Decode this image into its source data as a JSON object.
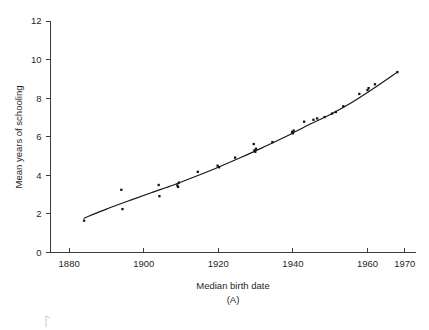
{
  "chart_data": {
    "type": "scatter",
    "title": "",
    "xlabel": "Median birth date",
    "ylabel": "Mean years of schooling",
    "panel_label": "(A)",
    "xlim": [
      1875,
      1973
    ],
    "ylim": [
      0,
      12
    ],
    "xticks": [
      1880,
      1900,
      1920,
      1940,
      1960,
      1970
    ],
    "xtick_labels": [
      "1880",
      "1900",
      "1920",
      "1940",
      "1960",
      "1970"
    ],
    "yticks": [
      0,
      2,
      4,
      6,
      8,
      10,
      12
    ],
    "ytick_labels": [
      "0",
      "2",
      "4",
      "6",
      "8",
      "10",
      "12"
    ],
    "grid": false,
    "legend": "none",
    "marker": "small filled square",
    "marker_color": "#141414",
    "line_color": "#161616",
    "background_color": "#ffffff",
    "points": [
      {
        "x": 1884.0,
        "y": 1.65
      },
      {
        "x": 1894.0,
        "y": 3.25
      },
      {
        "x": 1894.3,
        "y": 2.25
      },
      {
        "x": 1904.0,
        "y": 3.5
      },
      {
        "x": 1904.2,
        "y": 2.92
      },
      {
        "x": 1909.0,
        "y": 3.48
      },
      {
        "x": 1909.2,
        "y": 3.4
      },
      {
        "x": 1909.4,
        "y": 3.62
      },
      {
        "x": 1914.5,
        "y": 4.18
      },
      {
        "x": 1919.8,
        "y": 4.5
      },
      {
        "x": 1920.2,
        "y": 4.42
      },
      {
        "x": 1924.5,
        "y": 4.92
      },
      {
        "x": 1929.5,
        "y": 5.62
      },
      {
        "x": 1929.7,
        "y": 5.3
      },
      {
        "x": 1929.9,
        "y": 5.22
      },
      {
        "x": 1930.1,
        "y": 5.38
      },
      {
        "x": 1934.5,
        "y": 5.72
      },
      {
        "x": 1939.8,
        "y": 6.25
      },
      {
        "x": 1940.0,
        "y": 6.18
      },
      {
        "x": 1940.2,
        "y": 6.32
      },
      {
        "x": 1943.0,
        "y": 6.78
      },
      {
        "x": 1945.5,
        "y": 6.88
      },
      {
        "x": 1946.5,
        "y": 6.95
      },
      {
        "x": 1948.5,
        "y": 7.02
      },
      {
        "x": 1950.5,
        "y": 7.2
      },
      {
        "x": 1951.5,
        "y": 7.28
      },
      {
        "x": 1953.5,
        "y": 7.58
      },
      {
        "x": 1957.8,
        "y": 8.22
      },
      {
        "x": 1960.0,
        "y": 8.42
      },
      {
        "x": 1960.3,
        "y": 8.52
      },
      {
        "x": 1962.0,
        "y": 8.72
      },
      {
        "x": 1968.0,
        "y": 9.35
      }
    ],
    "fit_curve": [
      {
        "x": 1884.0,
        "y": 1.78
      },
      {
        "x": 1890.0,
        "y": 2.25
      },
      {
        "x": 1896.0,
        "y": 2.68
      },
      {
        "x": 1902.0,
        "y": 3.1
      },
      {
        "x": 1908.0,
        "y": 3.5
      },
      {
        "x": 1914.0,
        "y": 3.95
      },
      {
        "x": 1920.0,
        "y": 4.42
      },
      {
        "x": 1926.0,
        "y": 4.92
      },
      {
        "x": 1932.0,
        "y": 5.45
      },
      {
        "x": 1938.0,
        "y": 6.0
      },
      {
        "x": 1944.0,
        "y": 6.6
      },
      {
        "x": 1950.0,
        "y": 7.15
      },
      {
        "x": 1956.0,
        "y": 7.8
      },
      {
        "x": 1962.0,
        "y": 8.55
      },
      {
        "x": 1968.0,
        "y": 9.35
      }
    ]
  }
}
